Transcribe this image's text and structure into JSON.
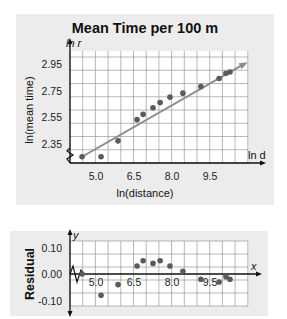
{
  "chart_data": [
    {
      "type": "scatter",
      "title": "Mean Time per 100 m",
      "xlabel": "ln(distance)",
      "ylabel": "ln(mean time)",
      "x_axis_name": "ln d",
      "y_axis_name": "ln r",
      "x_ticks": [
        "5.0",
        "6.5",
        "8.0",
        "9.5"
      ],
      "y_ticks": [
        "2.35",
        "2.55",
        "2.75",
        "2.95"
      ],
      "xlim": [
        4.2,
        11.2
      ],
      "ylim": [
        2.2,
        3.05
      ],
      "grid": true,
      "axis_break": true,
      "series": [
        {
          "name": "data",
          "x": [
            4.45,
            5.2,
            5.87,
            6.62,
            6.86,
            7.25,
            7.53,
            7.92,
            8.43,
            9.14,
            9.86,
            10.13,
            10.29
          ],
          "y": [
            2.25,
            2.25,
            2.37,
            2.53,
            2.57,
            2.62,
            2.66,
            2.7,
            2.73,
            2.78,
            2.84,
            2.88,
            2.89
          ]
        }
      ],
      "fit_line": {
        "x": [
          4.45,
          10.75
        ],
        "y": [
          2.25,
          2.94
        ],
        "color": "#8c8c8c"
      }
    },
    {
      "type": "scatter",
      "title": "",
      "xlabel": "",
      "ylabel": "Residual",
      "x_axis_name": "x",
      "y_axis_name": "y",
      "x_ticks": [
        "5.0",
        "6.5",
        "8.0",
        "9.5"
      ],
      "y_ticks": [
        "0.10",
        "0.00",
        "-0.10"
      ],
      "xlim": [
        4.2,
        11.2
      ],
      "ylim": [
        -0.12,
        0.12
      ],
      "grid": true,
      "axis_break": true,
      "series": [
        {
          "name": "residuals",
          "x": [
            4.45,
            5.2,
            5.87,
            6.62,
            6.86,
            7.25,
            7.53,
            7.92,
            8.43,
            9.14,
            9.86,
            10.13,
            10.29
          ],
          "y": [
            0.0,
            -0.08,
            -0.04,
            0.03,
            0.05,
            0.04,
            0.05,
            0.03,
            0.01,
            -0.02,
            -0.03,
            -0.01,
            -0.02
          ]
        }
      ]
    }
  ],
  "colors": {
    "panel": "#ececec",
    "grid": "#9a9a9a",
    "point": "#5a5a5a",
    "fit": "#8c8c8c",
    "axis": "#111111"
  }
}
